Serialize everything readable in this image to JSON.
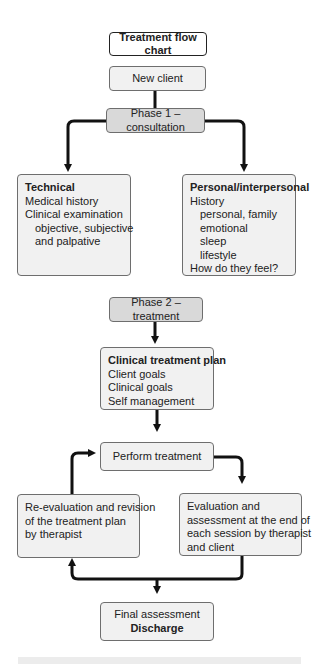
{
  "title": "Treatment flow chart",
  "nodes": {
    "new_client": "New client",
    "phase1": "Phase 1 – consultation",
    "technical": {
      "heading": "Technical",
      "lines": [
        "Medical history",
        "Clinical examination"
      ],
      "sub_lines": [
        "objective, subjective",
        "and palpative"
      ]
    },
    "personal": {
      "heading": "Personal/interpersonal",
      "line1": "History",
      "sub_lines": [
        "personal, family",
        "emotional",
        "sleep",
        "lifestyle"
      ],
      "line_last": "How do they feel?"
    },
    "phase2": "Phase 2 – treatment",
    "plan": {
      "heading": "Clinical treatment plan",
      "lines": [
        "Client goals",
        "Clinical goals",
        "Self management"
      ]
    },
    "perform": "Perform treatment",
    "reevaluation": [
      "Re-evaluation and revision",
      "of the treatment plan",
      "by therapist"
    ],
    "evaluation": [
      "Evaluation and",
      "assessment at the end of",
      "each session by therapist",
      "and client"
    ],
    "final": {
      "line1": "Final assessment",
      "line2": "Discharge"
    }
  },
  "colors": {
    "box_fill": "#f1f1f1",
    "phase_fill": "#d9d9d9",
    "border": "#6e6e6e",
    "arrow": "#111111"
  }
}
